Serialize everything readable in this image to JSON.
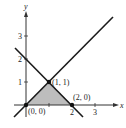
{
  "diagram": {
    "type": "coordinate-graph",
    "axes": {
      "x_label": "x",
      "y_label": "y",
      "x_ticks": [
        "2",
        "3"
      ],
      "y_ticks": [
        "1",
        "2",
        "3"
      ]
    },
    "lines": [
      {
        "name": "y = x",
        "color": "#1a1a1a"
      },
      {
        "name": "y = -x + 2",
        "color": "#1a1a1a"
      }
    ],
    "points": [
      {
        "label": "(0, 0)",
        "x": 0,
        "y": 0
      },
      {
        "label": "(1, 1)",
        "x": 1,
        "y": 1
      },
      {
        "label": "(2, 0)",
        "x": 2,
        "y": 0
      }
    ],
    "region": {
      "description": "shaded triangle bounded by y=x, y=-x+2, and x-axis",
      "fill": "#bdbdbd"
    }
  }
}
